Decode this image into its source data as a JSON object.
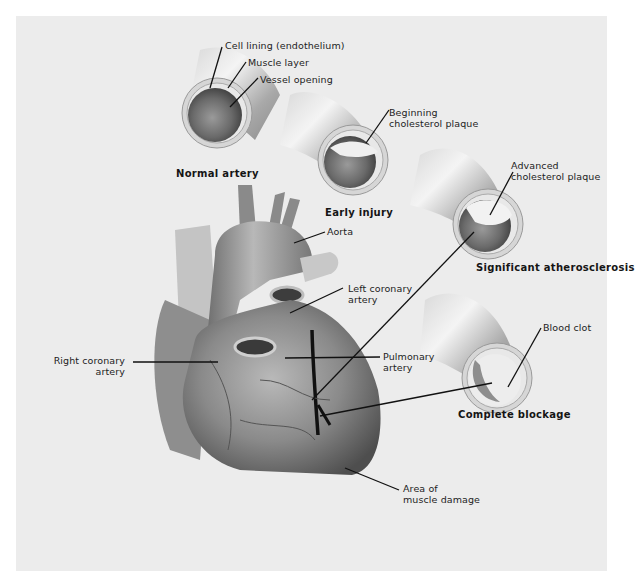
{
  "figure": {
    "type": "medical-illustration",
    "background": "#ececec"
  },
  "stages": [
    {
      "caption": "Normal artery",
      "labels": [
        "Cell lining (endothelium)",
        "Muscle layer",
        "Vessel opening"
      ]
    },
    {
      "caption": "Early injury",
      "labels": [
        "Beginning cholesterol plaque"
      ]
    },
    {
      "caption": "Significant atherosclerosis",
      "labels": [
        "Advanced cholesterol plaque"
      ]
    },
    {
      "caption": "Complete blockage",
      "labels": [
        "Blood clot"
      ]
    }
  ],
  "labels": {
    "cell_lining": "Cell lining (endothelium)",
    "muscle_layer": "Muscle layer",
    "vessel_opening": "Vessel opening",
    "beginning_plaque_1": "Beginning",
    "beginning_plaque_2": "cholesterol plaque",
    "advanced_plaque_1": "Advanced",
    "advanced_plaque_2": "cholesterol plaque",
    "blood_clot": "Blood clot",
    "aorta": "Aorta",
    "left_coronary_1": "Left coronary",
    "left_coronary_2": "artery",
    "right_coronary_1": "Right coronary",
    "right_coronary_2": "artery",
    "pulmonary_1": "Pulmonary",
    "pulmonary_2": "artery",
    "muscle_damage_1": "Area of",
    "muscle_damage_2": "muscle damage"
  },
  "captions": {
    "normal": "Normal artery",
    "early": "Early injury",
    "significant": "Significant atherosclerosis",
    "complete": "Complete blockage"
  }
}
